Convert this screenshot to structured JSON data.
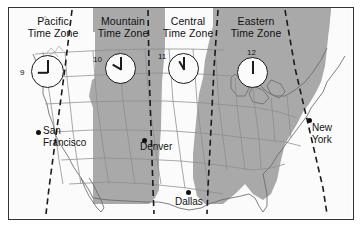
{
  "figure": {
    "background_color": "#ffffff",
    "frame_color": "#333333",
    "shaded_zone_color": "#a9a9a9",
    "light_zone_color": "#f2f2f2",
    "boundary_line_color": "#1b1b1b"
  },
  "zones": [
    {
      "id": "pacific",
      "label_line1": "Pacific",
      "label_line2": "Time Zone",
      "shaded": false,
      "clock": {
        "hour_text": "9",
        "hour_angle_deg": 270,
        "minute_angle_deg": 0
      }
    },
    {
      "id": "mountain",
      "label_line1": "Mountain",
      "label_line2": "Time Zone",
      "shaded": true,
      "clock": {
        "hour_text": "10",
        "hour_angle_deg": 300,
        "minute_angle_deg": 0
      }
    },
    {
      "id": "central",
      "label_line1": "Central",
      "label_line2": "Time Zone",
      "shaded": false,
      "clock": {
        "hour_text": "11",
        "hour_angle_deg": 330,
        "minute_angle_deg": 0
      }
    },
    {
      "id": "eastern",
      "label_line1": "Eastern",
      "label_line2": "Time Zone",
      "shaded": true,
      "clock": {
        "hour_text": "12",
        "hour_angle_deg": 0,
        "minute_angle_deg": 0
      }
    }
  ],
  "cities": [
    {
      "id": "san-francisco",
      "line1": "San",
      "line2": "Francisco"
    },
    {
      "id": "denver",
      "line1": "Denver",
      "line2": ""
    },
    {
      "id": "dallas",
      "line1": "Dallas",
      "line2": ""
    },
    {
      "id": "new-york",
      "line1": "New",
      "line2": "York"
    }
  ]
}
